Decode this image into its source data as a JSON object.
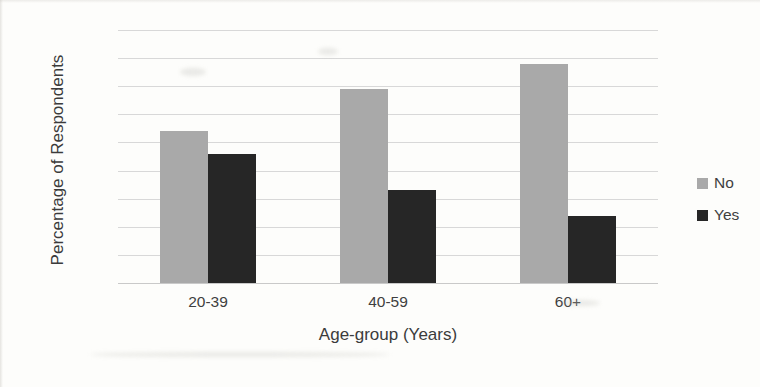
{
  "chart_data": {
    "type": "bar",
    "title": "",
    "xlabel": "Age-group (Years)",
    "ylabel": "Percentage of Respondents",
    "categories": [
      "20-39",
      "40-59",
      "60+"
    ],
    "series": [
      {
        "name": "No",
        "color": "#a9a9a9",
        "values": [
          54,
          69,
          78
        ]
      },
      {
        "name": "Yes",
        "color": "#262626",
        "values": [
          46,
          33,
          24
        ]
      }
    ],
    "ylim": [
      0,
      90
    ],
    "ytick_labels": [
      "0%",
      "10%",
      "20%",
      "30%",
      "40%",
      "50%",
      "60%",
      "70%",
      "80%",
      "90%"
    ],
    "ytick_values": [
      0,
      10,
      20,
      30,
      40,
      50,
      60,
      70,
      80,
      90
    ],
    "grid": true,
    "legend_position": "right",
    "legend_entries": [
      "No",
      "Yes"
    ]
  }
}
